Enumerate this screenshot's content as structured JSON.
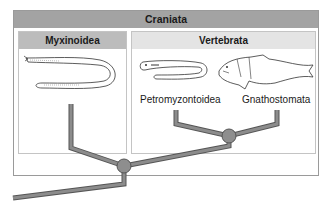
{
  "diagram": {
    "title": "Craniata",
    "groups": [
      {
        "name": "Myxinoidea",
        "members": []
      },
      {
        "name": "Vertebrata",
        "members": [
          "Petromyzontoidea",
          "Gnathostomata"
        ]
      }
    ],
    "taxa": {
      "hagfish": "Myxinoidea",
      "lamprey": "Petromyzontoidea",
      "jawed_fish": "Gnathostomata"
    },
    "nodes": [
      {
        "id": "craniata-node",
        "x": 124,
        "y": 166
      },
      {
        "id": "vertebrata-node",
        "x": 229,
        "y": 136
      }
    ],
    "colors": {
      "outer_header": "#a3a3a3",
      "myxinoidea_header": "#bcbcbc",
      "vertebrata_header": "#e4e4e4",
      "branch": "#8a8a8a",
      "branch_outline": "#555555",
      "node": "#8e8e8e"
    }
  }
}
